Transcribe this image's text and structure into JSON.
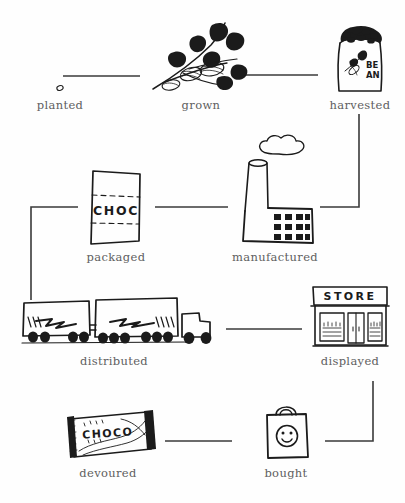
{
  "diagram": {
    "type": "flow-cycle",
    "ink_color": "#1b1b1b",
    "label_color": "#5e5e5e",
    "connector_color": "#3a3a3a",
    "background_color": "#fefefe"
  },
  "nodes": [
    {
      "id": "planted",
      "label": "planted",
      "icon": "seed-icon",
      "row": 1,
      "col": 1
    },
    {
      "id": "grown",
      "label": "grown",
      "icon": "cacao-branch-icon",
      "row": 1,
      "col": 2
    },
    {
      "id": "harvested",
      "label": "harvested",
      "icon": "bean-sack-icon",
      "row": 1,
      "col": 3
    },
    {
      "id": "packaged",
      "label": "packaged",
      "icon": "choc-package-icon",
      "row": 2,
      "col": 2
    },
    {
      "id": "manufactured",
      "label": "manufactured",
      "icon": "factory-icon",
      "row": 2,
      "col": 3
    },
    {
      "id": "distributed",
      "label": "distributed",
      "icon": "truck-icon",
      "row": 3,
      "col": 1
    },
    {
      "id": "displayed",
      "label": "displayed",
      "icon": "store-icon",
      "row": 3,
      "col": 3
    },
    {
      "id": "devoured",
      "label": "devoured",
      "icon": "chocolate-bar-icon",
      "row": 4,
      "col": 1
    },
    {
      "id": "bought",
      "label": "bought",
      "icon": "shopping-bag-icon",
      "row": 4,
      "col": 2
    }
  ],
  "icon_text": {
    "bean_sack_line1": "BE",
    "bean_sack_line2": "AN",
    "package_label": "CHOC",
    "store_sign": "STORE",
    "chocolate_bar_label": "CHOCO"
  },
  "connector_paths": [
    "planted-to-grown",
    "grown-to-harvested",
    "harvested-to-manufactured",
    "manufactured-to-packaged",
    "packaged-to-distributed",
    "distributed-to-displayed",
    "displayed-to-bought",
    "bought-to-devoured"
  ]
}
